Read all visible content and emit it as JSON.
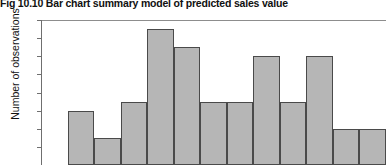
{
  "figure": {
    "number_label": "Fig 10.10",
    "title_text": "Bar chart summary model of predicted sales value",
    "full_title": "Fig 10.10  Bar chart summary model of predicted sales value"
  },
  "axes": {
    "y_axis_title": "Number of observations",
    "y_tick_labels": [
      "16",
      "14",
      "12",
      "10",
      "8",
      "6",
      "4",
      "2"
    ],
    "x_axis_title": ""
  },
  "colors": {
    "bar_fill": "#b6b6b6",
    "bar_stroke": "#4a4a4a",
    "axis": "#6f6f6f",
    "text": "#111111",
    "background": "#ffffff"
  },
  "chart_data": {
    "type": "bar",
    "title": "Fig 10.10  Bar chart summary model of predicted sales value",
    "xlabel": "",
    "ylabel": "Number of observations",
    "ylim": [
      0,
      16
    ],
    "ytick_values": [
      2,
      4,
      6,
      8,
      10,
      12,
      14,
      16
    ],
    "grid": false,
    "legend": "none",
    "categories": [
      "1",
      "2",
      "3",
      "4",
      "5",
      "6",
      "7",
      "8",
      "9",
      "10",
      "11",
      "12",
      "13"
    ],
    "values": [
      0,
      6,
      3,
      7,
      15,
      13,
      7,
      7,
      12,
      7,
      12,
      4,
      4
    ]
  }
}
